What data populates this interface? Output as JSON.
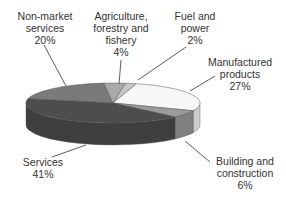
{
  "chart_data": {
    "type": "pie",
    "style": "3d-exploded-none",
    "title": "",
    "categories": [
      "Non-market services",
      "Agriculture, forestry and fishery",
      "Fuel and power",
      "Manufactured products",
      "Building and construction",
      "Services"
    ],
    "values": [
      20,
      4,
      2,
      27,
      6,
      41
    ],
    "unit": "%",
    "colors": [
      "#7a7a7a",
      "#a9a9a9",
      "#c8c8c8",
      "#f7f7f7",
      "#9b9b9b",
      "#4d4d4d"
    ],
    "legend": "none (leader-line labels)"
  },
  "labels": {
    "non_market": {
      "line1": "Non-market",
      "line2": "services",
      "pct": "20%"
    },
    "agriculture": {
      "line1": "Agriculture,",
      "line2": "forestry and",
      "line3": "fishery",
      "pct": "4%"
    },
    "fuel": {
      "line1": "Fuel and",
      "line2": "power",
      "pct": "2%"
    },
    "manufactured": {
      "line1": "Manufactured",
      "line2": "products",
      "pct": "27%"
    },
    "building": {
      "line1": "Building and",
      "line2": "construction",
      "pct": "6%"
    },
    "services": {
      "line1": "Services",
      "pct": "41%"
    }
  }
}
